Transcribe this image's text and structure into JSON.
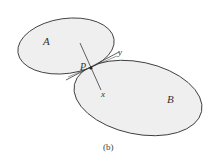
{
  "figure": {
    "caption": "(b)",
    "colors": {
      "background": "#ffffff",
      "body_fill": "#efefef",
      "stroke": "#3a3a3a",
      "text": "#333333"
    },
    "bodies": [
      {
        "id": "A",
        "label": "A"
      },
      {
        "id": "B",
        "label": "B"
      }
    ],
    "contact_point": {
      "label": "P"
    },
    "axes": {
      "normal": {
        "label": "x"
      },
      "tangent": {
        "label": "y"
      }
    }
  }
}
